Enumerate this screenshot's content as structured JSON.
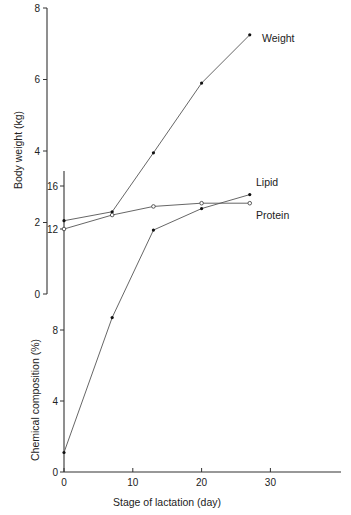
{
  "chart_data": {
    "type": "line",
    "title": "",
    "xlabel": "Stage of lactation (day)",
    "xlim": [
      0,
      40
    ],
    "x_ticks": [
      0,
      10,
      20,
      30
    ],
    "grid": false,
    "legend": "inline labels at line ends (right)",
    "axes": [
      {
        "id": "weight",
        "ylabel": "Body weight (kg)",
        "ylim": [
          0,
          8
        ],
        "y_ticks": [
          0,
          2,
          4,
          6,
          8
        ],
        "position": "upper"
      },
      {
        "id": "composition",
        "ylabel": "Chemical composition (%)",
        "ylim": [
          0,
          16
        ],
        "y_ticks": [
          0,
          4,
          8,
          12,
          16
        ],
        "position": "lower",
        "note": "axis broken between 8 and 12"
      }
    ],
    "series": [
      {
        "name": "Weight",
        "axis": "weight",
        "marker": "filled",
        "x": [
          0,
          7,
          13,
          20,
          27
        ],
        "values": [
          2.05,
          2.3,
          3.95,
          5.9,
          7.25
        ]
      },
      {
        "name": "Lipid",
        "axis": "composition",
        "marker": "filled",
        "x": [
          0,
          7,
          13,
          20,
          27
        ],
        "values": [
          1.1,
          8.7,
          11.9,
          13.9,
          15.2
        ]
      },
      {
        "name": "Protein",
        "axis": "composition",
        "marker": "open",
        "x": [
          0,
          7,
          13,
          20,
          27
        ],
        "values": [
          12.0,
          13.3,
          14.1,
          14.4,
          14.4
        ]
      }
    ]
  }
}
